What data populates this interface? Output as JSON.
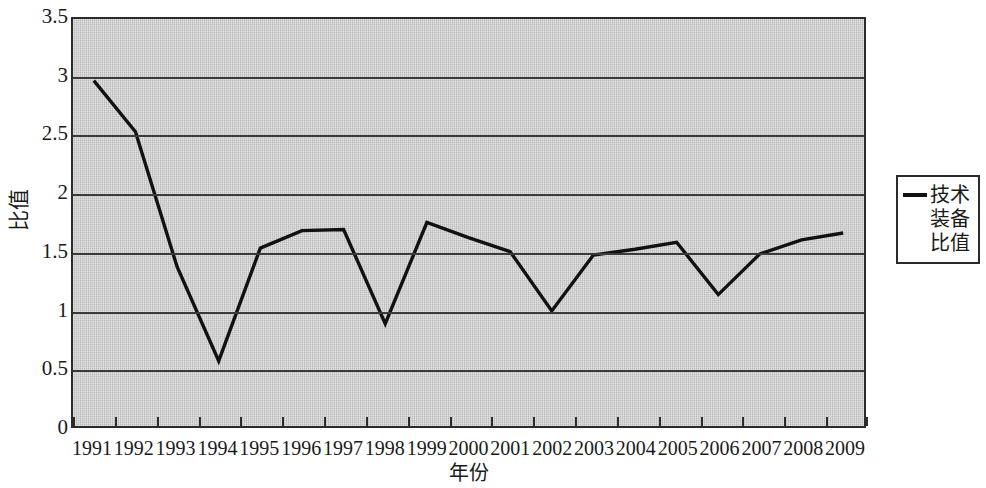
{
  "chart_data": {
    "type": "line",
    "title": "",
    "xlabel": "年份",
    "ylabel": "比值",
    "categories": [
      "1991",
      "1992",
      "1993",
      "1994",
      "1995",
      "1996",
      "1997",
      "1998",
      "1999",
      "2000",
      "2001",
      "2002",
      "2003",
      "2004",
      "2005",
      "2006",
      "2007",
      "2008",
      "2009"
    ],
    "series": [
      {
        "name": "技术装备比值",
        "values": [
          2.97,
          2.53,
          1.37,
          0.56,
          1.53,
          1.68,
          1.69,
          0.88,
          1.75,
          1.62,
          1.5,
          0.99,
          1.47,
          1.52,
          1.58,
          1.13,
          1.48,
          1.6,
          1.66
        ]
      }
    ],
    "ylim": [
      0,
      3.5
    ],
    "ytick_labels": [
      "3.5",
      "3",
      "2.5",
      "2",
      "1.5",
      "1",
      "0.5",
      "0"
    ],
    "ytick_values": [
      3.5,
      3,
      2.5,
      2,
      1.5,
      1,
      0.5,
      0
    ],
    "grid": "horizontal",
    "legend_position": "right",
    "plot_background_color": "#c9c9c9",
    "line_color": "#111111",
    "axis_color": "#2b2b2b"
  },
  "legend": {
    "entries": [
      {
        "label": "技术装备比值",
        "color": "#111111",
        "marker": "line"
      }
    ]
  }
}
